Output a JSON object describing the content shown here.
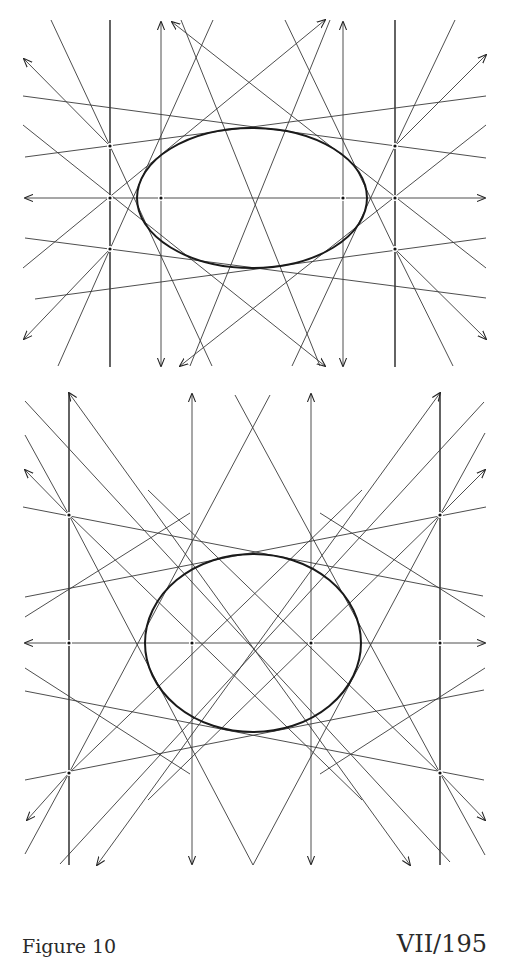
{
  "caption": {
    "figure_label": "Figure 10",
    "page_ref": "VII/195"
  },
  "figures": [
    {
      "id": "top",
      "description": "Ellipse inscribed in a net of tangent lines; wide ellipse",
      "ellipse": {
        "cx": 252,
        "cy": 198,
        "rx": 115,
        "ry": 70
      },
      "axis_y": 198,
      "verticals_x": [
        110,
        161,
        343,
        395
      ],
      "points": [
        [
          110,
          146
        ],
        [
          110,
          198
        ],
        [
          110,
          249
        ],
        [
          161,
          198
        ],
        [
          343,
          198
        ],
        [
          395,
          146
        ],
        [
          395,
          198
        ],
        [
          395,
          249
        ]
      ]
    },
    {
      "id": "bottom",
      "description": "Ellipse inscribed in a net of tangent lines; taller ellipse",
      "ellipse": {
        "cx": 253,
        "cy": 263,
        "rx": 108,
        "ry": 89
      },
      "axis_y": 263,
      "verticals_x": [
        69,
        192,
        311,
        440
      ],
      "points": [
        [
          69,
          135
        ],
        [
          69,
          263
        ],
        [
          69,
          393
        ],
        [
          192,
          263
        ],
        [
          311,
          263
        ],
        [
          440,
          135
        ],
        [
          440,
          263
        ],
        [
          440,
          393
        ]
      ]
    }
  ],
  "colors": {
    "ink": "#222222",
    "paper": "#ffffff"
  }
}
